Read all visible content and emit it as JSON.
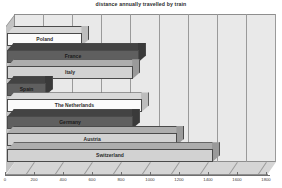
{
  "chart_data": {
    "type": "bar",
    "title": "distance annually travelled by train",
    "xlabel": "",
    "ylabel": "",
    "orientation": "horizontal",
    "grid": true,
    "legend": "none",
    "xlim": [
      0,
      1800
    ],
    "xticks": [
      "0",
      "200",
      "400",
      "600",
      "800",
      "1000",
      "1200",
      "1400",
      "1600",
      "1800"
    ],
    "categories": [
      "Poland",
      "France",
      "Italy",
      "Spain",
      "The Netherlands",
      "Germany",
      "Austria",
      "Switzerland"
    ],
    "values": [
      520,
      910,
      870,
      270,
      930,
      870,
      1175,
      1420
    ],
    "bars": [
      {
        "label": "Poland",
        "value": 520,
        "shade": "light"
      },
      {
        "label": "France",
        "value": 910,
        "shade": "dark"
      },
      {
        "label": "Italy",
        "value": 870,
        "shade": "mid"
      },
      {
        "label": "Spain",
        "value": 270,
        "shade": "dark"
      },
      {
        "label": "The Netherlands",
        "value": 930,
        "shade": "light"
      },
      {
        "label": "Germany",
        "value": 870,
        "shade": "dark"
      },
      {
        "label": "Austria",
        "value": 1175,
        "shade": "mid"
      },
      {
        "label": "Switzerland",
        "value": 1420,
        "shade": "mid"
      }
    ],
    "colors": {
      "light_bar": "#fbfbfb",
      "dark_bar": "#5f5f5f",
      "mid_bar": "#d2d2d2",
      "plot_background": "#e9e9e9",
      "floor": "#d5d5d5",
      "left_wall": "#c3c3c3",
      "gridline": "#9a9a9a",
      "outline": "#4a4a4a",
      "text": "#2b2b2b"
    }
  }
}
